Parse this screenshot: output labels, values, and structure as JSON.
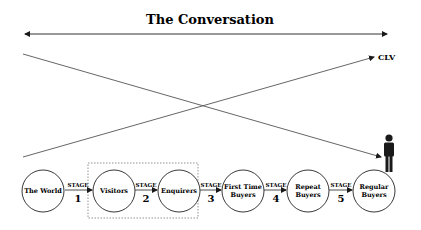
{
  "title": "The Conversation",
  "end_label": "CLV",
  "colors": {
    "stroke": "#1a1a1a",
    "line": "#555555",
    "dashed_box": "#777777",
    "person": "#1a1a1a",
    "background": "#ffffff"
  },
  "nodes": [
    {
      "id": "world",
      "lines": [
        "The World"
      ]
    },
    {
      "id": "visitors",
      "lines": [
        "Visitors"
      ]
    },
    {
      "id": "enquirers",
      "lines": [
        "Enquirers"
      ]
    },
    {
      "id": "first-time-buyers",
      "lines": [
        "First Time",
        "Buyers"
      ]
    },
    {
      "id": "repeat-buyers",
      "lines": [
        "Repeat",
        "Buyers"
      ]
    },
    {
      "id": "regular-buyers",
      "lines": [
        "Regular",
        "Buyers"
      ]
    }
  ],
  "stages": [
    {
      "label": "STAGE",
      "number": "1"
    },
    {
      "label": "STAGE",
      "number": "2"
    },
    {
      "label": "STAGE",
      "number": "3"
    },
    {
      "label": "STAGE",
      "number": "4"
    },
    {
      "label": "STAGE",
      "number": "5"
    }
  ],
  "icons": {
    "person": "person-icon"
  }
}
